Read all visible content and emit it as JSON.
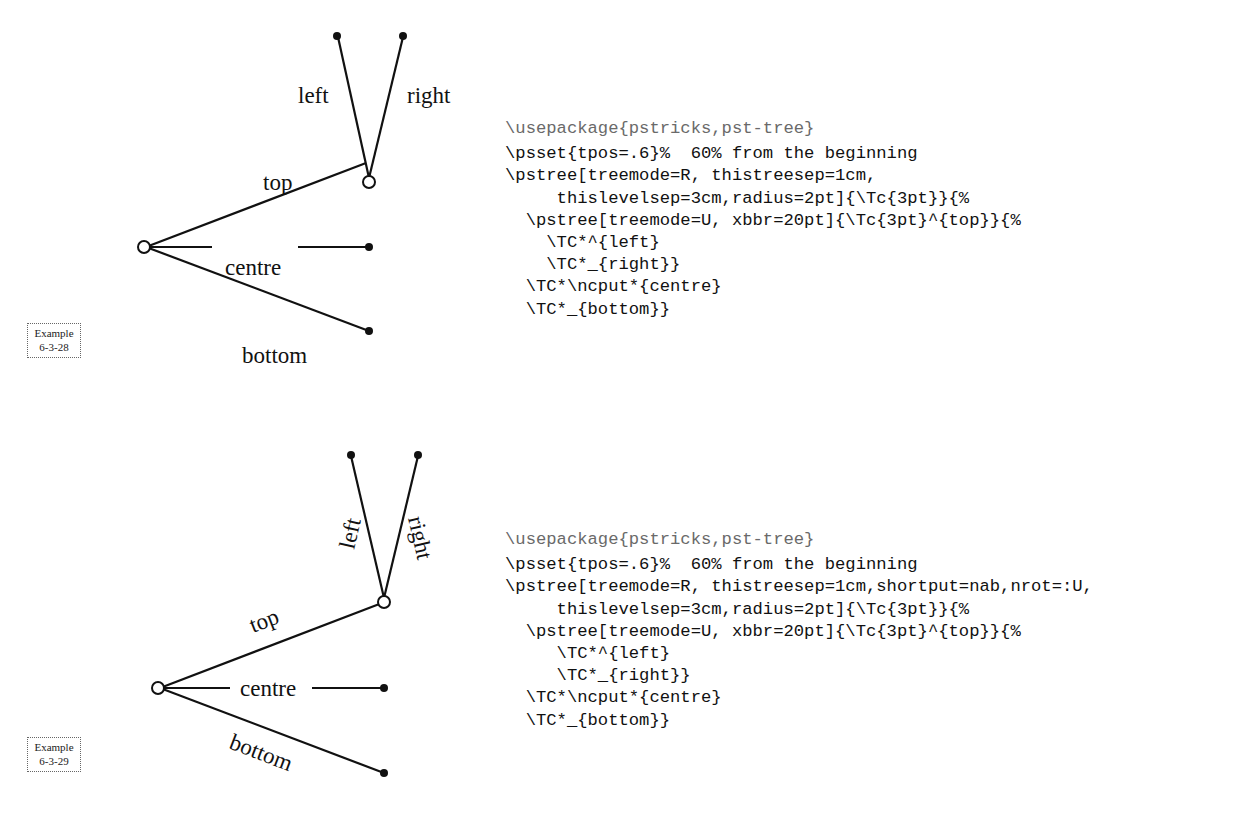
{
  "examples": [
    {
      "id_label": "Example",
      "number": "6-3-28",
      "diagram": {
        "labels": {
          "left": "left",
          "right": "right",
          "top": "top",
          "centre": "centre",
          "bottom": "bottom"
        },
        "label_style": "horizontal"
      },
      "code_lines": [
        "\\usepackage{pstricks,pst-tree}",
        "\\psset{tpos=.6}%  60% from the beginning",
        "\\pstree[treemode=R, thistreesep=1cm,",
        "     thislevelsep=3cm,radius=2pt]{\\Tc{3pt}}{%",
        "  \\pstree[treemode=U, xbbr=20pt]{\\Tc{3pt}^{top}}{%",
        "    \\TC*^{left}",
        "    \\TC*_{right}}",
        "  \\TC*\\ncput*{centre}",
        "  \\TC*_{bottom}}"
      ]
    },
    {
      "id_label": "Example",
      "number": "6-3-29",
      "diagram": {
        "labels": {
          "left": "left",
          "right": "right",
          "top": "top",
          "centre": "centre",
          "bottom": "bottom"
        },
        "label_style": "rotated-along-edge"
      },
      "code_lines": [
        "\\usepackage{pstricks,pst-tree}",
        "\\psset{tpos=.6}%  60% from the beginning",
        "\\pstree[treemode=R, thistreesep=1cm,shortput=nab,nrot=:U,",
        "     thislevelsep=3cm,radius=2pt]{\\Tc{3pt}}{%",
        "  \\pstree[treemode=U, xbbr=20pt]{\\Tc{3pt}^{top}}{%",
        "     \\TC*^{left}",
        "     \\TC*_{right}}",
        "  \\TC*\\ncput*{centre}",
        "  \\TC*_{bottom}}"
      ]
    }
  ]
}
